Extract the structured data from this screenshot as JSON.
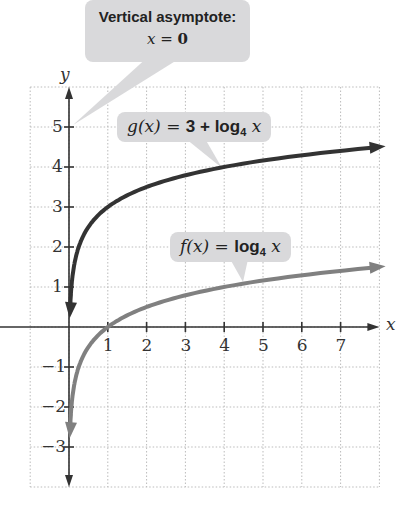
{
  "callouts": {
    "asymptote_line1": "Vertical asymptote:",
    "asymptote_x": "x",
    "asymptote_eq": " = ",
    "asymptote_val": "0",
    "g_fn": "g(x)",
    "g_eq": " = ",
    "g_rhs_num": "3 + log",
    "g_base": "4",
    "g_var": " x",
    "f_fn": "f(x)",
    "f_eq": " = ",
    "f_rhs": "log",
    "f_base": "4",
    "f_var": " x"
  },
  "axes": {
    "x_label": "x",
    "y_label": "y"
  },
  "chart_data": {
    "type": "line",
    "title": "",
    "xlabel": "x",
    "ylabel": "y",
    "xlim": [
      -1,
      8
    ],
    "ylim": [
      -4,
      6
    ],
    "x_ticks": [
      1,
      2,
      3,
      4,
      5,
      6,
      7
    ],
    "y_ticks": [
      -3,
      -2,
      -1,
      1,
      2,
      3,
      4,
      5
    ],
    "grid": true,
    "series": [
      {
        "name": "g(x) = 3 + log4 x",
        "color": "#333333",
        "x": [
          0.03,
          0.0625,
          0.25,
          1,
          2,
          4,
          7.8
        ],
        "y": [
          0.47,
          1,
          2,
          3,
          3.5,
          4,
          4.48
        ]
      },
      {
        "name": "f(x) = log4 x",
        "color": "#808080",
        "x": [
          0.03,
          0.0625,
          0.25,
          1,
          2,
          4,
          7.8
        ],
        "y": [
          -2.53,
          -2,
          -1,
          0,
          0.5,
          1,
          1.48
        ]
      }
    ],
    "annotations": [
      "Vertical asymptote: x = 0"
    ]
  },
  "colors": {
    "g": "#333333",
    "f": "#808080",
    "callout": "#d9d9db",
    "grid": "#bbbbbb"
  }
}
